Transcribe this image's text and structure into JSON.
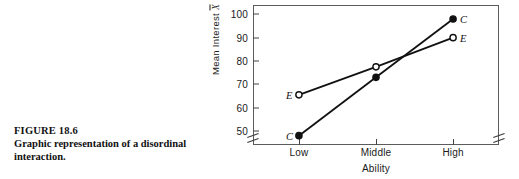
{
  "caption": {
    "figure_number": "FIGURE 18.6",
    "text": "Graphic representation of a disordinal interaction."
  },
  "chart_data": {
    "type": "line",
    "title": "",
    "xlabel": "Ability",
    "ylabel": "Mean Interest X̄",
    "ylabel_prefix": "Mean Interest ",
    "ylabel_symbol": "X",
    "categories": [
      "Low",
      "Middle",
      "High"
    ],
    "yticks": [
      50,
      60,
      70,
      80,
      90,
      100
    ],
    "ylim": [
      44,
      104
    ],
    "y_axis_break": true,
    "grid": false,
    "legend": "inline-endpoint-labels",
    "series": [
      {
        "name": "C",
        "label": "C",
        "marker": "filled-circle",
        "color": "#111111",
        "values": [
          48,
          73,
          98
        ],
        "start_label": "C",
        "end_label": "C"
      },
      {
        "name": "E",
        "label": "E",
        "marker": "open-circle",
        "color": "#111111",
        "values": [
          65.5,
          77.5,
          90
        ],
        "start_label": "E",
        "end_label": "E"
      }
    ]
  }
}
